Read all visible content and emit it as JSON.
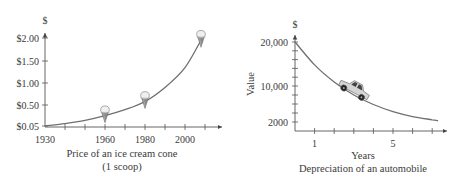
{
  "chart_data": [
    {
      "type": "line",
      "title": "Price of an ice cream cone",
      "subtitle": "(1 scoop)",
      "xlabel": "",
      "ylabel": "$",
      "x_ticks": [
        1930,
        1960,
        1980,
        2000
      ],
      "x_minor_step": 10,
      "y_ticks": [
        {
          "value": 0.05,
          "label": "$0.05"
        },
        {
          "value": 0.5,
          "label": "$0.50"
        },
        {
          "value": 1.0,
          "label": "$1.00"
        },
        {
          "value": 1.5,
          "label": "$1.50"
        },
        {
          "value": 2.0,
          "label": "$2.00"
        }
      ],
      "xlim": [
        1930,
        2015
      ],
      "ylim": [
        0.05,
        2.0
      ],
      "series": [
        {
          "name": "price",
          "x": [
            1930,
            1940,
            1950,
            1960,
            1970,
            1980,
            1990,
            2000,
            2008
          ],
          "y": [
            0.05,
            0.1,
            0.17,
            0.27,
            0.4,
            0.58,
            0.9,
            1.35,
            1.95
          ]
        }
      ],
      "markers": [
        {
          "name": "ice-cream-cone",
          "x": 1960,
          "y": 0.27
        },
        {
          "name": "ice-cream-cone",
          "x": 1980,
          "y": 0.58
        },
        {
          "name": "ice-cream-cone",
          "x": 2008,
          "y": 1.95
        }
      ],
      "grid": false
    },
    {
      "type": "line",
      "title": "Depreciation of an automobile",
      "xlabel": "Years",
      "ylabel": "Value",
      "y_unit_label": "$",
      "x_ticks": [
        1,
        5
      ],
      "x_minor_step": 1,
      "y_ticks": [
        {
          "value": 2000,
          "label": "2000"
        },
        {
          "value": 10000,
          "label": "10,000"
        },
        {
          "value": 20000,
          "label": "20,000"
        }
      ],
      "xlim": [
        0,
        7.5
      ],
      "ylim": [
        0,
        20000
      ],
      "series": [
        {
          "name": "value",
          "x": [
            0,
            1,
            2,
            3,
            4,
            5,
            6,
            7,
            7.3
          ],
          "y": [
            20000,
            14800,
            10900,
            8000,
            5900,
            4300,
            3200,
            2500,
            2300
          ]
        }
      ],
      "markers": [
        {
          "name": "car",
          "x": 3.0,
          "y": 9000
        }
      ],
      "grid": false
    }
  ]
}
